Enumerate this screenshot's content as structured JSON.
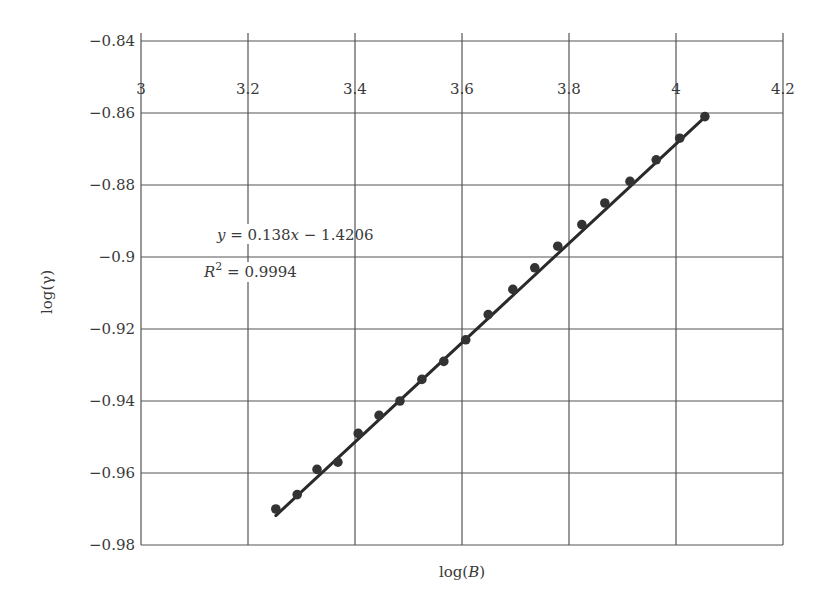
{
  "chart_data": {
    "type": "scatter",
    "title": "",
    "xlabel": "log(B)",
    "ylabel": "log(γ)",
    "xlim": [
      3,
      4.2
    ],
    "ylim": [
      -0.98,
      -0.84
    ],
    "grid": true,
    "x_ticks": [
      "3",
      "3.2",
      "3.4",
      "3.6",
      "3.8",
      "4",
      "4.2"
    ],
    "x_tick_values": [
      3,
      3.2,
      3.4,
      3.6,
      3.8,
      4,
      4.2
    ],
    "x_tick_position": "top-inside",
    "y_ticks": [
      "−0.84",
      "−0.86",
      "−0.88",
      "−0.9",
      "−0.92",
      "−0.94",
      "−0.96",
      "−0.98"
    ],
    "y_tick_values": [
      -0.84,
      -0.86,
      -0.88,
      -0.9,
      -0.92,
      -0.94,
      -0.96,
      -0.98
    ],
    "series": [
      {
        "name": "data",
        "marker": "circle",
        "x": [
          3.252,
          3.292,
          3.329,
          3.368,
          3.406,
          3.445,
          3.484,
          3.525,
          3.566,
          3.607,
          3.649,
          3.695,
          3.736,
          3.779,
          3.824,
          3.867,
          3.914,
          3.963,
          4.007,
          4.054
        ],
        "y": [
          -0.97,
          -0.966,
          -0.959,
          -0.957,
          -0.949,
          -0.944,
          -0.94,
          -0.934,
          -0.929,
          -0.923,
          -0.916,
          -0.909,
          -0.903,
          -0.897,
          -0.891,
          -0.885,
          -0.879,
          -0.873,
          -0.867,
          -0.861
        ]
      }
    ],
    "trendline": {
      "type": "linear",
      "slope": 0.138,
      "intercept": -1.4206,
      "x_range": [
        3.252,
        4.054
      ]
    },
    "annotations": [
      {
        "text": "y = 0.138x − 1.4206",
        "x": 3.28,
        "y": -0.896
      },
      {
        "text": "R² = 0.9994",
        "x": 3.23,
        "y": -0.907
      }
    ],
    "colors": {
      "points": "#333333",
      "line": "#2a2a2a",
      "grid": "#555555",
      "text": "#3a3a3a"
    }
  },
  "labels": {
    "xlabel_prefix": "log(",
    "xlabel_var": "B",
    "xlabel_suffix": ")",
    "ylabel": "log(γ)",
    "eq_y": "y",
    "eq_rest": " = 0.138",
    "eq_x": "x",
    "eq_tail": " − 1.4206",
    "r2_R": "R",
    "r2_sup": "2",
    "r2_rest": " = 0.9994"
  }
}
